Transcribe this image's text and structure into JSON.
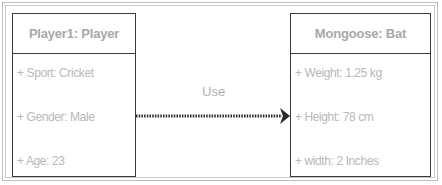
{
  "diagram": {
    "type": "uml-object-diagram",
    "objects": [
      {
        "title": "Player1: Player",
        "attributes": [
          "+ Sport: Cricket",
          "+ Gender: Male",
          "+ Age: 23"
        ]
      },
      {
        "title": "Mongoose: Bat",
        "attributes": [
          "+ Weight: 1.25 kg",
          "+ Height: 78 cm",
          "+ width: 2 Inches"
        ]
      }
    ],
    "relationship": {
      "label": "Use",
      "from": "Player1: Player",
      "to": "Mongoose: Bat",
      "style": "dotted-arrow"
    },
    "colors": {
      "border": "#3a3a3a",
      "text": "#a8a8a8",
      "frame": "#bdbdbd"
    }
  }
}
